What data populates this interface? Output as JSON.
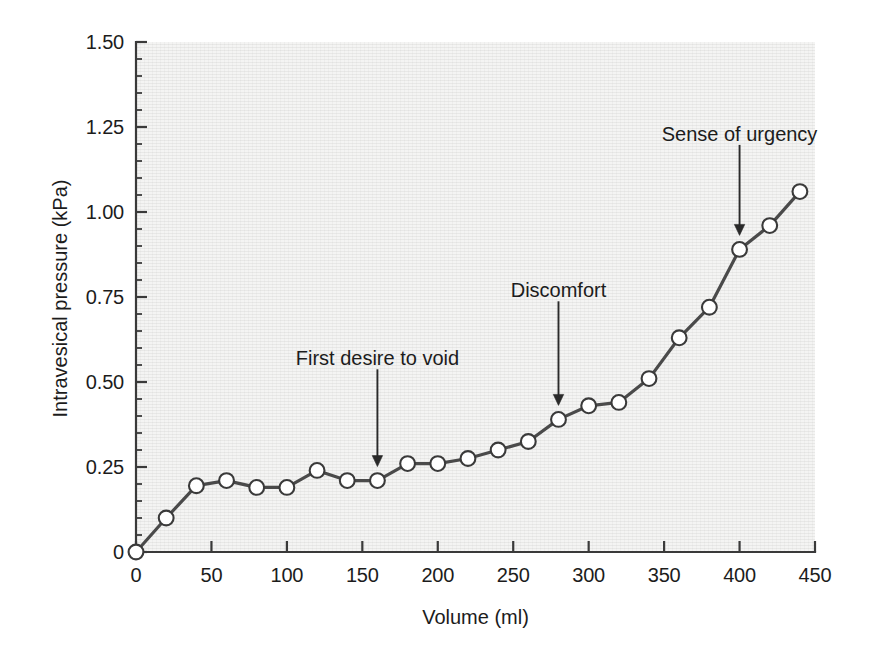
{
  "chart_data": {
    "type": "line",
    "title": "",
    "xlabel": "Volume (ml)",
    "ylabel": "Intravesical pressure (kPa)",
    "xlim": [
      0,
      450
    ],
    "ylim": [
      0,
      1.5
    ],
    "grid": false,
    "legend": "none",
    "x_ticks": [
      "0",
      "50",
      "100",
      "150",
      "200",
      "250",
      "300",
      "350",
      "400",
      "450"
    ],
    "x_tick_values": [
      0,
      50,
      100,
      150,
      200,
      250,
      300,
      350,
      400,
      450
    ],
    "x_minor_step": 10,
    "y_ticks": [
      "0",
      "0.25",
      "0.50",
      "0.75",
      "1.00",
      "1.25",
      "1.50"
    ],
    "y_tick_values": [
      0,
      0.25,
      0.5,
      0.75,
      1.0,
      1.25,
      1.5
    ],
    "y_minor_step": 0.05,
    "series": [
      {
        "name": "Intravesical pressure",
        "marker": "open-circle",
        "x": [
          0,
          20,
          40,
          60,
          80,
          100,
          120,
          140,
          160,
          180,
          200,
          220,
          240,
          260,
          280,
          300,
          320,
          340,
          360,
          380,
          400,
          420,
          440
        ],
        "values": [
          0.0,
          0.1,
          0.195,
          0.21,
          0.19,
          0.19,
          0.24,
          0.21,
          0.21,
          0.26,
          0.26,
          0.275,
          0.3,
          0.325,
          0.39,
          0.43,
          0.44,
          0.51,
          0.63,
          0.72,
          0.89,
          0.96,
          1.06
        ]
      }
    ],
    "annotations": [
      {
        "text": "First desire to void",
        "x": 160,
        "y": 0.21,
        "label_x": 160,
        "label_y": 0.555
      },
      {
        "text": "Discomfort",
        "x": 280,
        "y": 0.39,
        "label_x": 280,
        "label_y": 0.755
      },
      {
        "text": "Sense of urgency",
        "x": 400,
        "y": 0.89,
        "label_x": 400,
        "label_y": 1.215
      }
    ],
    "colors": {
      "line": "#4a4a4a",
      "marker_fill": "#ffffff",
      "marker_stroke": "#3a3a3a",
      "axis": "#3a3a3a",
      "text": "#1c1c1c",
      "plot_background": "#f4f4f3",
      "figure_background": "#ffffff",
      "annotation_arrow": "#2a2a2a"
    }
  }
}
